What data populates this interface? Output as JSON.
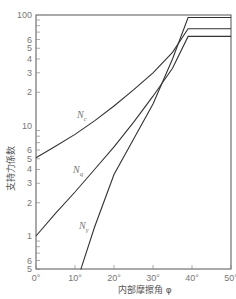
{
  "chart_data": {
    "type": "line",
    "title": "",
    "xlabel": "内部摩擦角 φ",
    "ylabel": "支持力係数",
    "xlim": [
      0,
      50
    ],
    "ylim": [
      0.5,
      100
    ],
    "yscale": "log",
    "grid": false,
    "legend": "inline curve labels",
    "x_ticks": [
      "0°",
      "10°",
      "20°",
      "30°",
      "40°",
      "50°"
    ],
    "y_tick_labels": [
      {
        "value": 100,
        "label": "100"
      },
      {
        "value": 60,
        "label": "6"
      },
      {
        "value": 50,
        "label": "5"
      },
      {
        "value": 40,
        "label": "4"
      },
      {
        "value": 30,
        "label": "3"
      },
      {
        "value": 20,
        "label": "2"
      },
      {
        "value": 10,
        "label": "10"
      },
      {
        "value": 6,
        "label": "6"
      },
      {
        "value": 5,
        "label": "5"
      },
      {
        "value": 4,
        "label": "4"
      },
      {
        "value": 3,
        "label": "3"
      },
      {
        "value": 2,
        "label": "2"
      },
      {
        "value": 1,
        "label": "1"
      },
      {
        "value": 0.6,
        "label": "6"
      },
      {
        "value": 0.5,
        "label": "5"
      }
    ],
    "series": [
      {
        "name": "Nc",
        "label_main": "N",
        "label_sub": "c",
        "x": [
          0,
          5,
          10,
          15,
          20,
          25,
          30,
          35,
          39,
          50
        ],
        "values": [
          5.1,
          6.5,
          8.3,
          11,
          15,
          21,
          30,
          46,
          75,
          75
        ]
      },
      {
        "name": "Nq",
        "label_main": "N",
        "label_sub": "q",
        "x": [
          0,
          5,
          10,
          15,
          20,
          25,
          30,
          35,
          39,
          50
        ],
        "values": [
          1.0,
          1.6,
          2.5,
          4.0,
          6.4,
          10.7,
          18.4,
          33,
          64,
          64
        ]
      },
      {
        "name": "Nγ",
        "label_main": "N",
        "label_sub": "γ",
        "x": [
          11.5,
          15,
          20,
          25,
          30,
          35,
          39,
          50
        ],
        "values": [
          0.5,
          1.2,
          3.6,
          7.5,
          15.7,
          40,
          95,
          95
        ]
      }
    ]
  }
}
